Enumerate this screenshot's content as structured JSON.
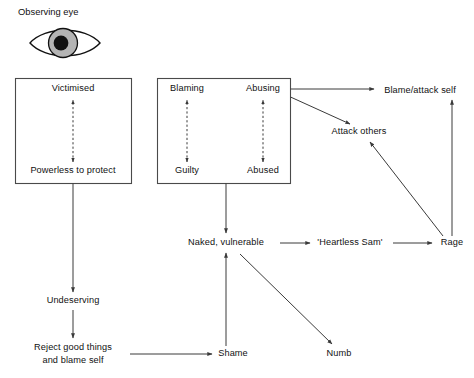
{
  "page": {
    "background_color": "#ffffff",
    "line_color": "#3a3a3a",
    "box_stroke_color": "#4a4a4a",
    "text_color": "#111111"
  },
  "heading": {
    "label": "Observing eye"
  },
  "icons": {
    "eye": {
      "name": "eye-icon",
      "iris_color": "#b4b4b4",
      "pupil_color": "#111111",
      "outline_color": "#111111"
    }
  },
  "groups": [
    {
      "id": "victim-box",
      "name": "victim-role-box",
      "nodes": [
        {
          "id": "victimised",
          "label": "Victimised",
          "x": 73,
          "y": 89
        },
        {
          "id": "powerless",
          "label": "Powerless to protect",
          "x": 73,
          "y": 171
        }
      ]
    },
    {
      "id": "abuser-box",
      "name": "abuser-role-box",
      "nodes": [
        {
          "id": "blaming",
          "label": "Blaming",
          "x": 187,
          "y": 89
        },
        {
          "id": "abusing",
          "label": "Abusing",
          "x": 263,
          "y": 89
        },
        {
          "id": "guilty",
          "label": "Guilty",
          "x": 187,
          "y": 171
        },
        {
          "id": "abused",
          "label": "Abused",
          "x": 263,
          "y": 171
        }
      ]
    }
  ],
  "nodes": [
    {
      "id": "blame-attack-self",
      "label": "Blame/attack self",
      "x": 420,
      "y": 91
    },
    {
      "id": "attack-others",
      "label": "Attack others",
      "x": 359,
      "y": 132
    },
    {
      "id": "naked-vulnerable",
      "label": "Naked, vulnerable",
      "x": 226,
      "y": 243
    },
    {
      "id": "heartless-sam",
      "label": "'Heartless Sam'",
      "x": 350,
      "y": 243
    },
    {
      "id": "rage",
      "label": "Rage",
      "x": 452,
      "y": 243
    },
    {
      "id": "undeserving",
      "label": "Undeserving",
      "x": 73,
      "y": 301
    },
    {
      "id": "reject-line1",
      "label": "Reject good things",
      "x": 73,
      "y": 348
    },
    {
      "id": "reject-line2",
      "label": "and blame self",
      "x": 73,
      "y": 360
    },
    {
      "id": "shame",
      "label": "Shame",
      "x": 233,
      "y": 354
    },
    {
      "id": "numb",
      "label": "Numb",
      "x": 339,
      "y": 354
    }
  ],
  "connections": [
    {
      "id": "victimised-powerless",
      "from": "powerless",
      "to": "victimised",
      "style": "dashed",
      "bidirectional": true
    },
    {
      "id": "blaming-guilty",
      "from": "guilty",
      "to": "blaming",
      "style": "dashed",
      "bidirectional": true
    },
    {
      "id": "abusing-abused",
      "from": "abused",
      "to": "abusing",
      "style": "dashed",
      "bidirectional": true
    },
    {
      "id": "abuser-box-to-blame-attack-self",
      "from": "abuser-box",
      "to": "blame-attack-self",
      "style": "solid"
    },
    {
      "id": "abuser-box-to-attack-others",
      "from": "abuser-box",
      "to": "attack-others",
      "style": "solid"
    },
    {
      "id": "victim-box-to-undeserving",
      "from": "victim-box",
      "to": "undeserving",
      "style": "solid"
    },
    {
      "id": "abuser-box-to-naked-vulnerable",
      "from": "abuser-box",
      "to": "naked-vulnerable",
      "style": "solid"
    },
    {
      "id": "naked-vulnerable-to-heartless-sam",
      "from": "naked-vulnerable",
      "to": "heartless-sam",
      "style": "solid"
    },
    {
      "id": "heartless-sam-to-rage",
      "from": "heartless-sam",
      "to": "rage",
      "style": "solid"
    },
    {
      "id": "rage-to-blame-attack-self",
      "from": "rage",
      "to": "blame-attack-self",
      "style": "solid"
    },
    {
      "id": "rage-to-attack-others",
      "from": "rage",
      "to": "attack-others",
      "style": "solid"
    },
    {
      "id": "undeserving-to-reject",
      "from": "undeserving",
      "to": "reject-line1",
      "style": "solid"
    },
    {
      "id": "reject-to-shame",
      "from": "reject-line2",
      "to": "shame",
      "style": "solid"
    },
    {
      "id": "shame-to-naked-vulnerable",
      "from": "shame",
      "to": "naked-vulnerable",
      "style": "solid"
    },
    {
      "id": "naked-vulnerable-to-numb",
      "from": "naked-vulnerable",
      "to": "numb",
      "style": "solid"
    }
  ]
}
